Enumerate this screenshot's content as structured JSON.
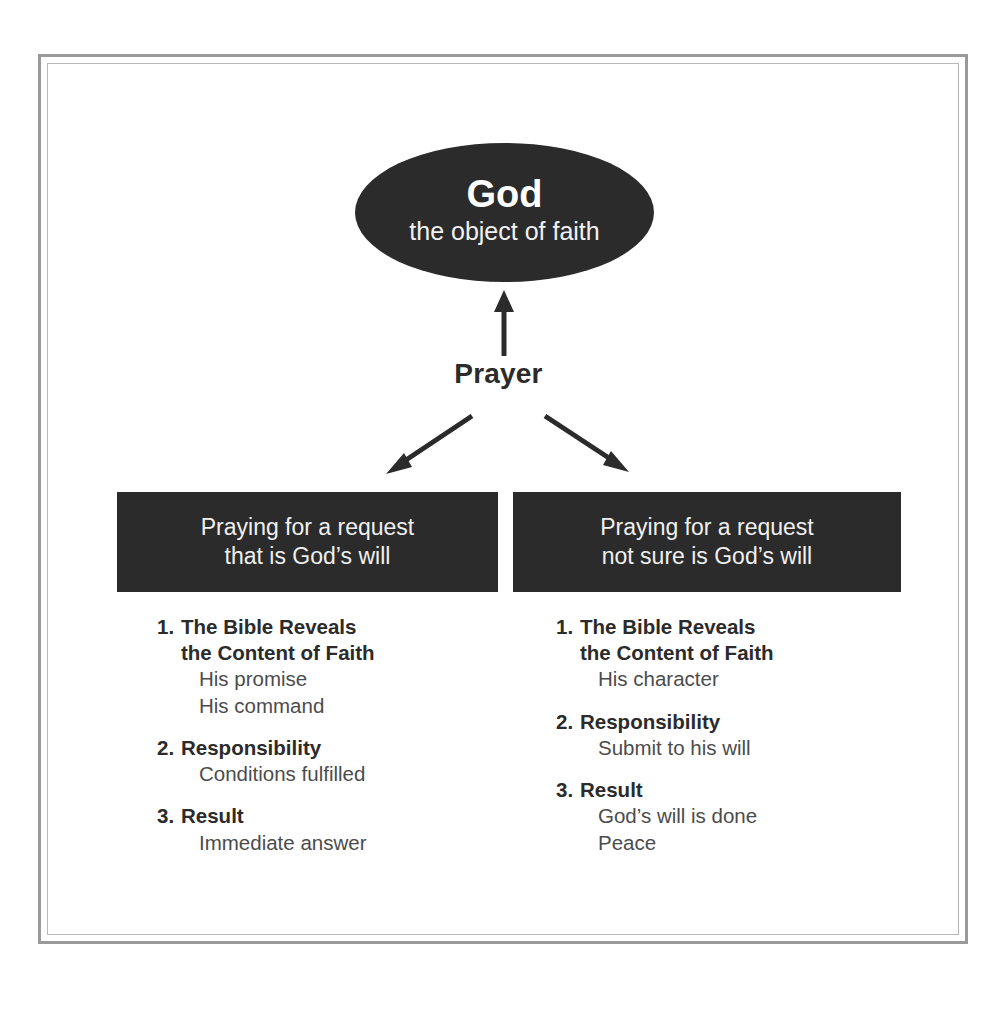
{
  "diagram": {
    "title_node": {
      "name": "God",
      "subtitle": "the object of faith",
      "fill": "#2b2b2b",
      "text_color": "#ffffff"
    },
    "connector_label": "Prayer",
    "arrows": [
      {
        "name": "prayer-to-god-arrow",
        "direction": "up"
      },
      {
        "name": "prayer-to-left-branch-arrow",
        "direction": "down-left"
      },
      {
        "name": "prayer-to-right-branch-arrow",
        "direction": "down-right"
      }
    ],
    "branches": [
      {
        "id": "left",
        "header_line1": "Praying for a request",
        "header_line2": "that is God’s will",
        "items": [
          {
            "number": "1.",
            "title": "The Bible Reveals\nthe Content of Faith",
            "subitems": [
              "His promise",
              "His command"
            ]
          },
          {
            "number": "2.",
            "title": "Responsibility",
            "subitems": [
              "Conditions fulfilled"
            ]
          },
          {
            "number": "3.",
            "title": "Result",
            "subitems": [
              "Immediate answer"
            ]
          }
        ]
      },
      {
        "id": "right",
        "header_line1": "Praying for a request",
        "header_line2": "not sure is God’s will",
        "items": [
          {
            "number": "1.",
            "title": "The Bible Reveals\nthe Content of Faith",
            "subitems": [
              "His character"
            ]
          },
          {
            "number": "2.",
            "title": "Responsibility",
            "subitems": [
              "Submit to his will"
            ]
          },
          {
            "number": "3.",
            "title": "Result",
            "subitems": [
              "God’s will is done",
              "Peace"
            ]
          }
        ]
      }
    ],
    "colors": {
      "node_fill": "#2b2b2b",
      "header_fill": "#2b2b2b",
      "bold_text": "#2b2b2b",
      "sub_text": "#4c4c4c",
      "frame_outer": "#9a9a9a",
      "frame_inner": "#b9b9b9",
      "page_background": "#ffffff"
    }
  }
}
